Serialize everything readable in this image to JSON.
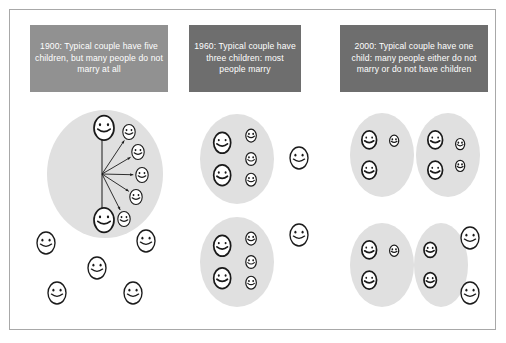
{
  "figure": {
    "title_visible": false,
    "background_color": "#ffffff",
    "frame_border_color": "#a8a8a8",
    "ellipse_fill_color": "#e0e0e0",
    "face_outline_color": "#1a1a1a",
    "arrow_color": "#1a1a1a"
  },
  "panels": [
    {
      "id": "panel-1900",
      "caption": "1900: Typical couple have five children, but many people do not marry at all",
      "caption_color": "#919191",
      "caption_text_color": "#ffffff",
      "caption_rect": {
        "x": 30,
        "y": 25,
        "w": 138,
        "h": 67
      },
      "family_groups": [
        {
          "id": "family-1900-a",
          "parents": 2,
          "children": 5,
          "has_arrows": true,
          "ellipse": {
            "cx": 105,
            "cy": 174,
            "rx": 58,
            "ry": 64
          }
        }
      ],
      "single_people": [
        {
          "x": 46,
          "y": 243
        },
        {
          "x": 146,
          "y": 241
        },
        {
          "x": 97,
          "y": 268
        },
        {
          "x": 57,
          "y": 293
        },
        {
          "x": 133,
          "y": 293
        }
      ]
    },
    {
      "id": "panel-1960",
      "caption": "1960: Typical couple have three children: most people marry",
      "caption_color": "#6e6e6e",
      "caption_text_color": "#ffffff",
      "caption_rect": {
        "x": 189,
        "y": 25,
        "w": 112,
        "h": 67
      },
      "family_groups": [
        {
          "id": "family-1960-a",
          "parents": 2,
          "children": 3,
          "has_arrows": false,
          "ellipse": {
            "cx": 237,
            "cy": 159,
            "rx": 37,
            "ry": 45
          }
        },
        {
          "id": "family-1960-b",
          "parents": 2,
          "children": 3,
          "has_arrows": false,
          "ellipse": {
            "cx": 237,
            "cy": 262,
            "rx": 37,
            "ry": 45
          }
        }
      ],
      "single_people": [
        {
          "x": 299,
          "y": 158
        },
        {
          "x": 299,
          "y": 235
        }
      ]
    },
    {
      "id": "panel-2000",
      "caption": "2000: Typical couple have one child: many people either do not marry or do not have children",
      "caption_color": "#6e6e6e",
      "caption_text_color": "#ffffff",
      "caption_rect": {
        "x": 340,
        "y": 25,
        "w": 148,
        "h": 67
      },
      "family_groups": [
        {
          "id": "family-2000-a",
          "parents": 2,
          "children": 1,
          "has_arrows": false,
          "ellipse": {
            "cx": 382,
            "cy": 155,
            "rx": 32,
            "ry": 42
          }
        },
        {
          "id": "family-2000-b",
          "parents": 2,
          "children": 2,
          "has_arrows": false,
          "ellipse": {
            "cx": 448,
            "cy": 155,
            "rx": 32,
            "ry": 42
          }
        },
        {
          "id": "family-2000-c",
          "parents": 2,
          "children": 1,
          "has_arrows": false,
          "ellipse": {
            "cx": 382,
            "cy": 265,
            "rx": 32,
            "ry": 42
          }
        },
        {
          "id": "family-2000-d",
          "parents": 2,
          "children": 0,
          "has_arrows": false,
          "ellipse": {
            "cx": 441,
            "cy": 265,
            "rx": 27,
            "ry": 42
          }
        }
      ],
      "single_people": [
        {
          "x": 470,
          "y": 238
        },
        {
          "x": 470,
          "y": 293
        }
      ]
    }
  ],
  "chart_data": {
    "type": "diagram",
    "categories": [
      "1900",
      "1960",
      "2000"
    ],
    "series": [
      {
        "name": "Children per typical couple",
        "values": [
          5,
          3,
          1
        ]
      },
      {
        "name": "Family groups shown",
        "values": [
          1,
          2,
          4
        ]
      },
      {
        "name": "Unmarried single people shown",
        "values": [
          5,
          2,
          2
        ]
      }
    ],
    "notes": [
      "1900: Typical couple have five children, but many people do not marry at all",
      "1960: Typical couple have three children: most people marry",
      "2000: Typical couple have one child: many people either do not marry or do not have children"
    ],
    "legend": "none",
    "grid": false
  }
}
